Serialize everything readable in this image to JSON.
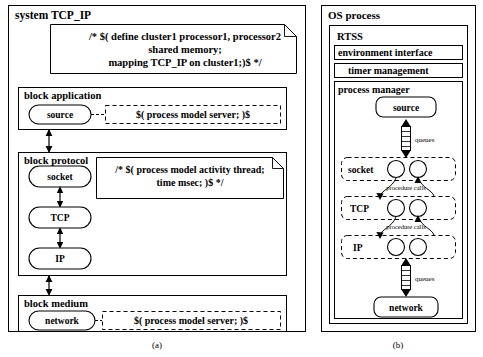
{
  "figure": {
    "caption_a": "(a)",
    "caption_b": "(b)"
  },
  "panel_a": {
    "title": "system TCP_IP",
    "system_note": {
      "line1": "/* $( define cluster1 processor1, processor2",
      "line2": "shared memory;",
      "line3": "mapping TCP_IP on cluster1;)$  */"
    },
    "blocks": [
      {
        "title": "block  application",
        "node": "source",
        "annotation": "$( process model server; )$"
      },
      {
        "title": "block protocol",
        "nodes": [
          "socket",
          "TCP",
          "IP"
        ],
        "note": {
          "line1": "/* $( process model activity thread;",
          "line2": "time msec; )$ */"
        }
      },
      {
        "title": "block medium",
        "node": "network",
        "annotation": "$( process model server; )$"
      }
    ]
  },
  "panel_b": {
    "title": "OS process",
    "rtss": {
      "title": "RTSS",
      "bars": [
        "environment interface",
        "timer management"
      ],
      "process_manager": {
        "title": "process manager",
        "top_node": "source",
        "bottom_node": "network",
        "layers": [
          "socket",
          "TCP",
          "IP"
        ],
        "queue_label_top": "queues",
        "queue_label_bottom": "queues",
        "procedure_label_1": "procedure calls",
        "procedure_label_2": "procedure calls"
      }
    }
  },
  "colors": {
    "ink": "#000000",
    "paper": "#ffffff"
  }
}
